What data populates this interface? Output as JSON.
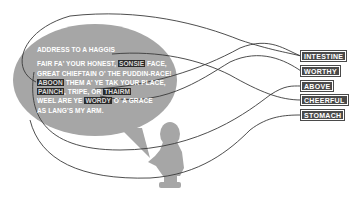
{
  "poem": {
    "title": "ADDRESS TO A HAGGIS",
    "lines": [
      [
        {
          "t": "FAIR FA' YOUR HONEST, "
        },
        {
          "t": "SONSIE",
          "hl": true
        },
        {
          "t": " FACE,"
        }
      ],
      [
        {
          "t": "GREAT CHIEFTAIN O' THE PUDDIN-RACE!"
        }
      ],
      [
        {
          "t": "ABOON",
          "hl": true
        },
        {
          "t": " THEM A' YE TAK YOUR PLACE,"
        }
      ],
      [
        {
          "t": "PAINCH",
          "hl": true
        },
        {
          "t": ", TRIPE, OR "
        },
        {
          "t": "THAIRM",
          "hl": true
        }
      ],
      [
        {
          "t": "WEEL ARE YE "
        },
        {
          "t": "WORDY",
          "hl": true
        },
        {
          "t": " O' A GRACE"
        }
      ],
      [
        {
          "t": "AS LANG'S MY ARM."
        }
      ]
    ]
  },
  "glossary": [
    {
      "word": "INTESTINE",
      "y": 51
    },
    {
      "word": "WORTHY",
      "y": 66
    },
    {
      "word": "ABOVE",
      "y": 81
    },
    {
      "word": "CHEERFUL",
      "y": 95
    },
    {
      "word": "STOMACH",
      "y": 110
    }
  ],
  "colors": {
    "bubble": "#a6a6a6",
    "bust": "#a6a6a6",
    "line": "#3a3a3a",
    "label_bg": "#4a4a4a",
    "highlight_bg": "#2a2a2a"
  }
}
